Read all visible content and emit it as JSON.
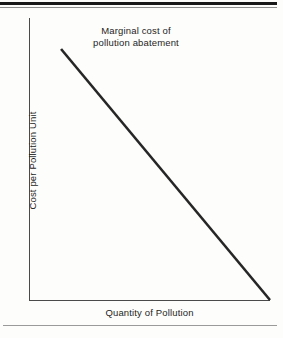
{
  "figure": {
    "background_color": "#fdfdfb",
    "ink_color": "#1d1d1d",
    "axis_color": "#4a4a4a",
    "rule_color": "#191919"
  },
  "chart_data": {
    "type": "line",
    "title": "Marginal cost of\npollution abatement",
    "title_line_1": "Marginal cost of",
    "title_line_2": "pollution abatement",
    "xlabel": "Quantity of Pollution",
    "ylabel": "Cost per Pollution Unit",
    "grid": false,
    "legend": false,
    "legend_position": "none",
    "xlim": [
      0,
      100
    ],
    "ylim": [
      0,
      100
    ],
    "xticks": [],
    "yticks": [],
    "xticklabels": [],
    "yticklabels": [],
    "series": [
      {
        "name": "Marginal cost of pollution abatement",
        "color": "#262626",
        "linewidth": 2.6,
        "x": [
          13.3,
          100.0
        ],
        "y": [
          89.0,
          0.0
        ],
        "points": [
          {
            "x": 13.3,
            "y": 89.0
          },
          {
            "x": 100.0,
            "y": 0.0
          }
        ]
      }
    ],
    "annotations": [
      {
        "text": "Marginal cost of pollution abatement",
        "x": 44,
        "y": 97,
        "role": "curve-label"
      }
    ]
  },
  "rules": {
    "top_thick": "page-rule-top-thick",
    "top_thin": "page-rule-top-thin",
    "bottom": "page-rule-bottom"
  }
}
